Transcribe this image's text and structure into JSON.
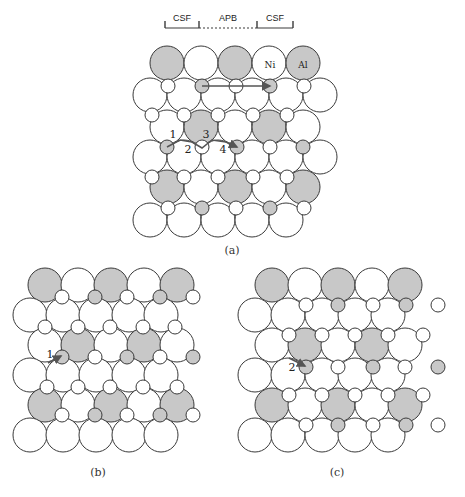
{
  "figure": {
    "header": {
      "labels": [
        {
          "text": "CSF",
          "x": 182,
          "y": 21
        },
        {
          "text": "APB",
          "x": 228,
          "y": 21
        },
        {
          "text": "CSF",
          "x": 275,
          "y": 21
        }
      ],
      "line_y": 28,
      "ticks_x": [
        165,
        199,
        257,
        293
      ],
      "segments": [
        {
          "x1": 165,
          "x2": 199,
          "style": "solid"
        },
        {
          "x1": 199,
          "x2": 257,
          "style": "dashed"
        },
        {
          "x1": 257,
          "x2": 293,
          "style": "solid"
        }
      ]
    },
    "colors": {
      "gray_fill": "#c8c8c8",
      "white_fill": "#ffffff",
      "stroke": "#3a3a3a",
      "arrow": "#555555"
    },
    "radius": {
      "large": 17,
      "small": 7
    },
    "panels": [
      {
        "id": "a",
        "caption": "(a)",
        "caption_pos": {
          "x": 232,
          "y": 254
        },
        "large_rows": [
          {
            "y": 63,
            "atoms": [
              [
                167,
                "g"
              ],
              [
                201,
                "w"
              ],
              [
                235,
                "g"
              ],
              [
                269,
                "w"
              ],
              [
                303,
                "g"
              ]
            ]
          },
          {
            "y": 95,
            "atoms": [
              [
                150,
                "w"
              ],
              [
                184,
                "w"
              ],
              [
                218,
                "w"
              ],
              [
                252,
                "w"
              ],
              [
                286,
                "w"
              ],
              [
                320,
                "w"
              ]
            ]
          },
          {
            "y": 127,
            "atoms": [
              [
                167,
                "w"
              ],
              [
                201,
                "g"
              ],
              [
                235,
                "w"
              ],
              [
                269,
                "g"
              ],
              [
                303,
                "w"
              ]
            ]
          },
          {
            "y": 157,
            "atoms": [
              [
                150,
                "w"
              ],
              [
                184,
                "w"
              ],
              [
                218,
                "w"
              ],
              [
                252,
                "w"
              ],
              [
                286,
                "w"
              ],
              [
                320,
                "w"
              ]
            ]
          },
          {
            "y": 187,
            "atoms": [
              [
                167,
                "g"
              ],
              [
                201,
                "w"
              ],
              [
                235,
                "g"
              ],
              [
                269,
                "w"
              ],
              [
                303,
                "g"
              ]
            ]
          },
          {
            "y": 220,
            "atoms": [
              [
                150,
                "w"
              ],
              [
                184,
                "w"
              ],
              [
                218,
                "w"
              ],
              [
                252,
                "w"
              ],
              [
                286,
                "w"
              ]
            ]
          }
        ],
        "small_rows": [
          {
            "y": 86,
            "atoms": [
              [
                168,
                "w"
              ],
              [
                202,
                "g"
              ],
              [
                236,
                "w"
              ],
              [
                270,
                "g"
              ],
              [
                304,
                "w"
              ]
            ]
          },
          {
            "y": 115,
            "atoms": [
              [
                152,
                "w"
              ],
              [
                184,
                "w"
              ],
              [
                218,
                "w"
              ],
              [
                253,
                "w"
              ],
              [
                287,
                "w"
              ]
            ]
          },
          {
            "y": 147,
            "atoms": [
              [
                167,
                "g"
              ],
              [
                202,
                "w"
              ],
              [
                237,
                "g"
              ],
              [
                270,
                "w"
              ],
              [
                303,
                "g"
              ]
            ]
          },
          {
            "y": 177,
            "atoms": [
              [
                152,
                "w"
              ],
              [
                184,
                "w"
              ],
              [
                218,
                "w"
              ],
              [
                253,
                "w"
              ],
              [
                287,
                "w"
              ]
            ]
          },
          {
            "y": 208,
            "atoms": [
              [
                168,
                "w"
              ],
              [
                202,
                "g"
              ],
              [
                236,
                "w"
              ],
              [
                270,
                "g"
              ],
              [
                304,
                "w"
              ]
            ]
          }
        ],
        "atom_labels": [
          {
            "text": "Ni",
            "x": 270,
            "y": 68
          },
          {
            "text": "Al",
            "x": 303,
            "y": 68
          }
        ],
        "path_labels": [
          {
            "text": "1",
            "x": 173,
            "y": 138
          },
          {
            "text": "2",
            "x": 188,
            "y": 153
          },
          {
            "text": "3",
            "x": 206,
            "y": 138
          },
          {
            "text": "4",
            "x": 223,
            "y": 153
          }
        ],
        "arrows": [
          {
            "name": "long-shift-arrow",
            "points": "202,86 270,86"
          },
          {
            "name": "path-1-2-3-4-arrow",
            "points": "167,147 180,140 192,142 202,148 212,140 226,142 237,147"
          }
        ]
      },
      {
        "id": "b",
        "caption": "(b)",
        "caption_pos": {
          "x": 98,
          "y": 476
        },
        "large_rows": [
          {
            "y": 285,
            "atoms": [
              [
                45,
                "g"
              ],
              [
                78,
                "w"
              ],
              [
                111,
                "g"
              ],
              [
                144,
                "w"
              ],
              [
                177,
                "g"
              ]
            ]
          },
          {
            "y": 315,
            "atoms": [
              [
                30,
                "w"
              ],
              [
                63,
                "w"
              ],
              [
                96,
                "w"
              ],
              [
                129,
                "w"
              ],
              [
                161,
                "w"
              ]
            ]
          },
          {
            "y": 345,
            "atoms": [
              [
                45,
                "w"
              ],
              [
                78,
                "g"
              ],
              [
                111,
                "w"
              ],
              [
                144,
                "g"
              ],
              [
                177,
                "w"
              ]
            ]
          },
          {
            "y": 375,
            "atoms": [
              [
                30,
                "w"
              ],
              [
                63,
                "w"
              ],
              [
                96,
                "w"
              ],
              [
                129,
                "w"
              ],
              [
                161,
                "w"
              ]
            ]
          },
          {
            "y": 405,
            "atoms": [
              [
                45,
                "g"
              ],
              [
                78,
                "w"
              ],
              [
                111,
                "g"
              ],
              [
                144,
                "w"
              ],
              [
                177,
                "g"
              ]
            ]
          },
          {
            "y": 435,
            "atoms": [
              [
                30,
                "w"
              ],
              [
                63,
                "w"
              ],
              [
                96,
                "w"
              ],
              [
                129,
                "w"
              ],
              [
                161,
                "w"
              ]
            ]
          }
        ],
        "small_rows": [
          {
            "y": 297,
            "atoms": [
              [
                62,
                "w"
              ],
              [
                95,
                "g"
              ],
              [
                127,
                "w"
              ],
              [
                160,
                "g"
              ],
              [
                193,
                "w"
              ]
            ]
          },
          {
            "y": 327,
            "atoms": [
              [
                45,
                "w"
              ],
              [
                78,
                "w"
              ],
              [
                110,
                "w"
              ],
              [
                143,
                "w"
              ],
              [
                175,
                "w"
              ]
            ]
          },
          {
            "y": 357,
            "atoms": [
              [
                62,
                "g"
              ],
              [
                95,
                "w"
              ],
              [
                127,
                "g"
              ],
              [
                160,
                "w"
              ],
              [
                193,
                "g"
              ]
            ]
          },
          {
            "y": 387,
            "atoms": [
              [
                47,
                "w"
              ],
              [
                78,
                "w"
              ],
              [
                110,
                "w"
              ],
              [
                143,
                "w"
              ],
              [
                177,
                "w"
              ]
            ]
          },
          {
            "y": 415,
            "atoms": [
              [
                62,
                "w"
              ],
              [
                95,
                "g"
              ],
              [
                127,
                "w"
              ],
              [
                160,
                "g"
              ],
              [
                193,
                "w"
              ]
            ]
          }
        ],
        "atom_labels": [],
        "path_labels": [
          {
            "text": "1",
            "x": 50,
            "y": 358
          }
        ],
        "arrows": [
          {
            "name": "step-1-arrow",
            "points": "48,363 61,356"
          }
        ]
      },
      {
        "id": "c",
        "caption": "(c)",
        "caption_pos": {
          "x": 337,
          "y": 476
        },
        "large_rows": [
          {
            "y": 285,
            "atoms": [
              [
                272,
                "g"
              ],
              [
                305,
                "w"
              ],
              [
                338,
                "g"
              ],
              [
                372,
                "w"
              ],
              [
                405,
                "g"
              ]
            ]
          },
          {
            "y": 315,
            "atoms": [
              [
                255,
                "w"
              ],
              [
                288,
                "w"
              ],
              [
                322,
                "w"
              ],
              [
                355,
                "w"
              ],
              [
                388,
                "w"
              ]
            ]
          },
          {
            "y": 345,
            "atoms": [
              [
                272,
                "w"
              ],
              [
                305,
                "g"
              ],
              [
                338,
                "w"
              ],
              [
                372,
                "g"
              ],
              [
                405,
                "w"
              ]
            ]
          },
          {
            "y": 375,
            "atoms": [
              [
                255,
                "w"
              ],
              [
                288,
                "w"
              ],
              [
                322,
                "w"
              ],
              [
                355,
                "w"
              ],
              [
                388,
                "w"
              ]
            ]
          },
          {
            "y": 405,
            "atoms": [
              [
                272,
                "g"
              ],
              [
                305,
                "w"
              ],
              [
                338,
                "g"
              ],
              [
                372,
                "w"
              ],
              [
                405,
                "g"
              ]
            ]
          },
          {
            "y": 435,
            "atoms": [
              [
                255,
                "w"
              ],
              [
                288,
                "w"
              ],
              [
                322,
                "w"
              ],
              [
                355,
                "w"
              ],
              [
                388,
                "w"
              ]
            ]
          }
        ],
        "small_rows": [
          {
            "y": 305,
            "atoms": [
              [
                306,
                "w"
              ],
              [
                338,
                "g"
              ],
              [
                373,
                "w"
              ],
              [
                406,
                "g"
              ]
            ]
          },
          {
            "y": 335,
            "atoms": [
              [
                289,
                "w"
              ],
              [
                322,
                "w"
              ],
              [
                355,
                "w"
              ],
              [
                388,
                "w"
              ],
              [
                423,
                "w"
              ]
            ]
          },
          {
            "y": 367,
            "atoms": [
              [
                306,
                "g"
              ],
              [
                338,
                "w"
              ],
              [
                373,
                "g"
              ],
              [
                405,
                "w"
              ]
            ]
          },
          {
            "y": 395,
            "atoms": [
              [
                289,
                "w"
              ],
              [
                322,
                "w"
              ],
              [
                355,
                "w"
              ],
              [
                388,
                "w"
              ],
              [
                423,
                "w"
              ]
            ]
          },
          {
            "y": 425,
            "atoms": [
              [
                306,
                "w"
              ],
              [
                338,
                "g"
              ],
              [
                373,
                "w"
              ],
              [
                406,
                "g"
              ]
            ]
          }
        ],
        "isolated_atoms": [
          [
            438,
            305,
            "w"
          ],
          [
            438,
            367,
            "g"
          ],
          [
            438,
            425,
            "w"
          ]
        ],
        "atom_labels": [],
        "path_labels": [
          {
            "text": "2",
            "x": 292,
            "y": 371
          }
        ],
        "arrows": [
          {
            "name": "step-2-arrow",
            "points": "289,358 305,366"
          }
        ]
      }
    ]
  }
}
